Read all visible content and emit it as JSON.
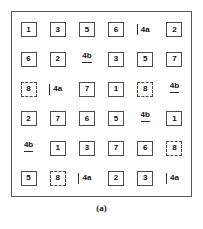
{
  "figure": {
    "caption": "(a)",
    "border_color": "#5a5a5a",
    "box_border_color": "#4a4a4a",
    "text_color": "#0f0f0f",
    "rows": 6,
    "columns": 6,
    "cells": [
      [
        {
          "label": "1",
          "style": "box"
        },
        {
          "label": "3",
          "style": "box"
        },
        {
          "label": "5",
          "style": "box"
        },
        {
          "label": "6",
          "style": "box"
        },
        {
          "label": "4a",
          "style": "bar"
        },
        {
          "label": "2",
          "style": "box"
        }
      ],
      [
        {
          "label": "6",
          "style": "box"
        },
        {
          "label": "2",
          "style": "box"
        },
        {
          "label": "4b",
          "style": "underline"
        },
        {
          "label": "3",
          "style": "box"
        },
        {
          "label": "5",
          "style": "box"
        },
        {
          "label": "7",
          "style": "box"
        }
      ],
      [
        {
          "label": "8",
          "style": "box-dashed"
        },
        {
          "label": "4a",
          "style": "bar"
        },
        {
          "label": "7",
          "style": "box"
        },
        {
          "label": "1",
          "style": "box"
        },
        {
          "label": "8",
          "style": "box-dashed"
        },
        {
          "label": "4b",
          "style": "underline"
        }
      ],
      [
        {
          "label": "2",
          "style": "box"
        },
        {
          "label": "7",
          "style": "box"
        },
        {
          "label": "6",
          "style": "box"
        },
        {
          "label": "5",
          "style": "box"
        },
        {
          "label": "4b",
          "style": "underline"
        },
        {
          "label": "1",
          "style": "box"
        }
      ],
      [
        {
          "label": "4b",
          "style": "underline"
        },
        {
          "label": "1",
          "style": "box"
        },
        {
          "label": "3",
          "style": "box"
        },
        {
          "label": "7",
          "style": "box"
        },
        {
          "label": "6",
          "style": "box"
        },
        {
          "label": "8",
          "style": "box-dashed"
        }
      ],
      [
        {
          "label": "5",
          "style": "box"
        },
        {
          "label": "8",
          "style": "box-dashed"
        },
        {
          "label": "4a",
          "style": "bar"
        },
        {
          "label": "2",
          "style": "box"
        },
        {
          "label": "3",
          "style": "box"
        },
        {
          "label": "4a",
          "style": "bar"
        }
      ]
    ]
  }
}
